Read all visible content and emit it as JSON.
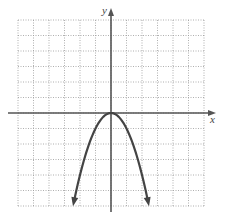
{
  "chart_data": {
    "type": "line",
    "title": "",
    "xlabel": "x",
    "ylabel": "y",
    "xlim": [
      -6,
      6
    ],
    "ylim": [
      -6,
      6
    ],
    "grid": true,
    "grid_style": "dotted",
    "function": "y = -x^2",
    "vertex": [
      0,
      0
    ],
    "opens": "down",
    "arrows_at_ends": true,
    "series": [
      {
        "name": "parabola",
        "x": [
          -2.4,
          -2,
          -1.5,
          -1,
          -0.5,
          0,
          0.5,
          1,
          1.5,
          2,
          2.4
        ],
        "values": [
          -5.76,
          -4,
          -2.25,
          -1,
          -0.25,
          0,
          -0.25,
          -1,
          -2.25,
          -4,
          -5.76
        ]
      }
    ]
  },
  "colors": {
    "grid": "#9a9a9a",
    "axes": "#555555",
    "curve": "#444444"
  }
}
